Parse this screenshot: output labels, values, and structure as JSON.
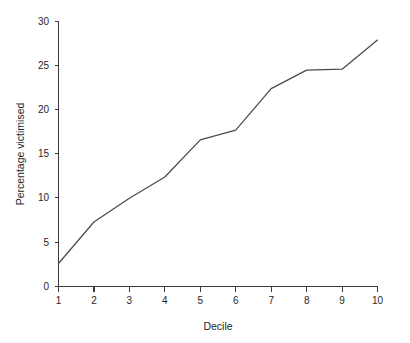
{
  "chart_data": {
    "type": "line",
    "title": "",
    "xlabel": "Decile",
    "ylabel": "Percentage victimised",
    "categories": [
      "1",
      "2",
      "3",
      "4",
      "5",
      "6",
      "7",
      "8",
      "9",
      "10"
    ],
    "x": [
      1,
      2,
      3,
      4,
      5,
      6,
      7,
      8,
      9,
      10
    ],
    "values": [
      2.6,
      7.3,
      10.0,
      12.4,
      16.6,
      17.7,
      22.4,
      24.5,
      24.6,
      27.9
    ],
    "series": [
      {
        "name": "Percentage victimised",
        "values": [
          2.6,
          7.3,
          10.0,
          12.4,
          16.6,
          17.7,
          22.4,
          24.5,
          24.6,
          27.9
        ]
      }
    ],
    "xlim": [
      1,
      10
    ],
    "ylim": [
      0,
      30
    ],
    "x_ticks": [
      "1",
      "2",
      "3",
      "4",
      "5",
      "6",
      "7",
      "8",
      "9",
      "10"
    ],
    "y_ticks": [
      "0",
      "5",
      "10",
      "15",
      "20",
      "25",
      "30"
    ],
    "y_tick_values": [
      0,
      5,
      10,
      15,
      20,
      25,
      30
    ],
    "grid": "off",
    "legend": "none",
    "line_color": "#4a4a4a",
    "axis_color": "#3b3b3b",
    "background_color": "#ffffff"
  },
  "axes": {
    "x_title": "Decile",
    "y_title": "Percentage victimised"
  }
}
